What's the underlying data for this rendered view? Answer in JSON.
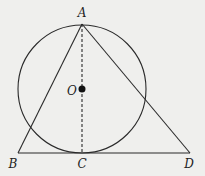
{
  "figure": {
    "background": "#efefed",
    "stroke_color": "#2a2a2a",
    "circle": {
      "center": "O",
      "cx": 82,
      "cy": 89,
      "r": 64
    },
    "points": {
      "A": {
        "label": "A",
        "x": 82,
        "y": 24,
        "label_x": 82,
        "label_y": 17
      },
      "B": {
        "label": "B",
        "x": 18,
        "y": 153,
        "label_x": 13,
        "label_y": 168
      },
      "C": {
        "label": "C",
        "x": 82,
        "y": 153,
        "label_x": 82,
        "label_y": 168
      },
      "D": {
        "label": "D",
        "x": 190,
        "y": 153,
        "label_x": 189,
        "label_y": 168
      },
      "O": {
        "label": "O",
        "x": 82,
        "y": 89,
        "label_x": 72,
        "label_y": 95
      }
    },
    "segments": [
      {
        "name": "AB",
        "style": "solid"
      },
      {
        "name": "AD",
        "style": "solid"
      },
      {
        "name": "BD",
        "style": "solid"
      },
      {
        "name": "AC",
        "style": "dashed"
      }
    ]
  }
}
